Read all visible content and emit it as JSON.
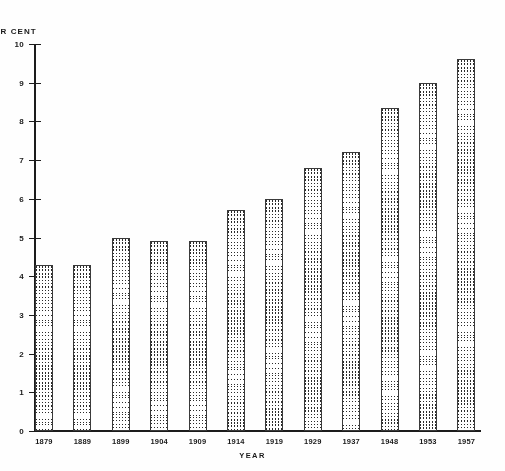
{
  "chart_data": {
    "type": "bar",
    "title": "",
    "subtitle": "",
    "ylabel": "ER CENT",
    "xlabel": "YEAR",
    "categories": [
      "1879",
      "1889",
      "1899",
      "1904",
      "1909",
      "1914",
      "1919",
      "1929",
      "1937",
      "1948",
      "1953",
      "1957"
    ],
    "values": [
      4.3,
      4.3,
      5.0,
      4.9,
      4.9,
      5.7,
      6.0,
      6.8,
      7.2,
      8.35,
      9.0,
      9.6
    ],
    "ylim": [
      0,
      10
    ],
    "ytick_labels": [
      "0",
      "1",
      "2",
      "3",
      "4",
      "5",
      "6",
      "7",
      "8",
      "9",
      "10"
    ],
    "ytick_values": [
      0,
      1,
      2,
      3,
      4,
      5,
      6,
      7,
      8,
      9,
      10
    ],
    "grid": false,
    "legend": null,
    "series": [
      {
        "name": "",
        "values": [
          4.3,
          4.3,
          5.0,
          4.9,
          4.9,
          5.7,
          6.0,
          6.8,
          7.2,
          8.35,
          9.0,
          9.6
        ]
      }
    ],
    "bar_fill": "checkerboard-stipple",
    "bar_edge_color": "#3a3a3a",
    "axis_color": "#1c1c1c",
    "background_color": "#fefefe"
  }
}
